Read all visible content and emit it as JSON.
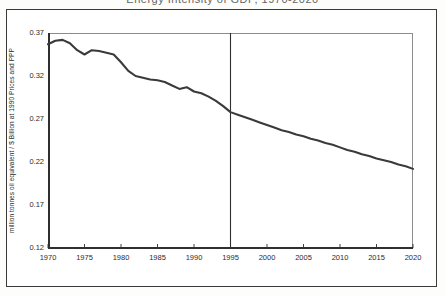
{
  "page": {
    "title_remnant": "Energy Intensity of GDP, 1970-2020"
  },
  "axis": {
    "y_title": "million tonnes oil equivalent / $ Billion at 1990 Prices and PPP",
    "y_ticks": [
      "0.37",
      "0.32",
      "0.27",
      "0.22",
      "0.17",
      "0.12"
    ],
    "x_ticks": [
      "1970",
      "1975",
      "1980",
      "1985",
      "1990",
      "1995",
      "2000",
      "2005",
      "2010",
      "2015",
      "2020"
    ]
  },
  "colors": {
    "line": "#3a3a3a",
    "frame": "#3a3a3a",
    "plot_border": "#8c8c8c",
    "axis_spine": "#2f2f2f",
    "divider": "#2f2f2f",
    "text": "#2b2b2b",
    "background": "#ffffff"
  },
  "chart_data": {
    "type": "line",
    "title": "",
    "xlabel": "",
    "ylabel": "million tonnes oil equivalent / $ Billion at 1990 Prices and PPP",
    "xlim": [
      1970,
      2020
    ],
    "ylim": [
      0.12,
      0.37
    ],
    "xtick_step": 5,
    "ytick_step": 0.05,
    "grid": false,
    "legend": "none",
    "annotations": [
      {
        "type": "vertical-line",
        "x": 1995,
        "label": "history / projection divider"
      }
    ],
    "series": [
      {
        "name": "Energy intensity",
        "x": [
          1970,
          1971,
          1972,
          1973,
          1974,
          1975,
          1976,
          1977,
          1978,
          1979,
          1980,
          1981,
          1982,
          1983,
          1984,
          1985,
          1986,
          1987,
          1988,
          1989,
          1990,
          1991,
          1992,
          1993,
          1994,
          1995,
          1996,
          1997,
          1998,
          1999,
          2000,
          2001,
          2002,
          2003,
          2004,
          2005,
          2006,
          2007,
          2008,
          2009,
          2010,
          2011,
          2012,
          2013,
          2014,
          2015,
          2016,
          2017,
          2018,
          2019,
          2020
        ],
        "y": [
          0.357,
          0.361,
          0.362,
          0.358,
          0.35,
          0.345,
          0.35,
          0.349,
          0.347,
          0.345,
          0.336,
          0.326,
          0.32,
          0.318,
          0.316,
          0.315,
          0.313,
          0.309,
          0.305,
          0.307,
          0.302,
          0.3,
          0.296,
          0.291,
          0.285,
          0.278,
          0.275,
          0.272,
          0.269,
          0.266,
          0.263,
          0.26,
          0.257,
          0.255,
          0.252,
          0.25,
          0.247,
          0.245,
          0.242,
          0.24,
          0.237,
          0.234,
          0.232,
          0.229,
          0.227,
          0.224,
          0.222,
          0.22,
          0.217,
          0.215,
          0.212
        ]
      }
    ]
  }
}
